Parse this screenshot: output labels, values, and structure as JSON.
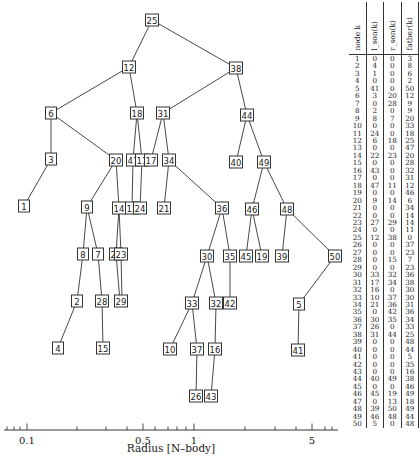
{
  "diagram": {
    "type": "binary_tree_over_log_radius_axis",
    "nodes": [
      {
        "id": "25",
        "x": 152,
        "y": 20
      },
      {
        "id": "12",
        "x": 129,
        "y": 67
      },
      {
        "id": "38",
        "x": 236,
        "y": 68
      },
      {
        "id": "6",
        "x": 51,
        "y": 113
      },
      {
        "id": "18",
        "x": 137,
        "y": 113
      },
      {
        "id": "31",
        "x": 163,
        "y": 113
      },
      {
        "id": "44",
        "x": 247,
        "y": 115
      },
      {
        "id": "3",
        "x": 51,
        "y": 159
      },
      {
        "id": "20",
        "x": 116,
        "y": 160
      },
      {
        "id": "47",
        "x": 133,
        "y": 160
      },
      {
        "id": "11",
        "x": 142,
        "y": 160
      },
      {
        "id": "17",
        "x": 151,
        "y": 160
      },
      {
        "id": "34",
        "x": 169,
        "y": 160
      },
      {
        "id": "40",
        "x": 236,
        "y": 162
      },
      {
        "id": "49",
        "x": 264,
        "y": 162
      },
      {
        "id": "1",
        "x": 24,
        "y": 206
      },
      {
        "id": "9",
        "x": 87,
        "y": 207
      },
      {
        "id": "14",
        "x": 119,
        "y": 208
      },
      {
        "id": "12",
        "x": 132,
        "y": 208
      },
      {
        "id": "24",
        "x": 140,
        "y": 208
      },
      {
        "id": "21",
        "x": 164,
        "y": 208
      },
      {
        "id": "36",
        "x": 222,
        "y": 208
      },
      {
        "id": "46",
        "x": 252,
        "y": 209
      },
      {
        "id": "48",
        "x": 287,
        "y": 209
      },
      {
        "id": "8",
        "x": 83,
        "y": 254
      },
      {
        "id": "7",
        "x": 98,
        "y": 254
      },
      {
        "id": "22",
        "x": 116,
        "y": 254
      },
      {
        "id": "23",
        "x": 121,
        "y": 254
      },
      {
        "id": "30",
        "x": 207,
        "y": 256
      },
      {
        "id": "35",
        "x": 230,
        "y": 256
      },
      {
        "id": "45",
        "x": 246,
        "y": 256
      },
      {
        "id": "19",
        "x": 262,
        "y": 256
      },
      {
        "id": "39",
        "x": 282,
        "y": 256
      },
      {
        "id": "50",
        "x": 335,
        "y": 256
      },
      {
        "id": "2",
        "x": 77,
        "y": 301
      },
      {
        "id": "28",
        "x": 102,
        "y": 301
      },
      {
        "id": "29",
        "x": 121,
        "y": 301
      },
      {
        "id": "33",
        "x": 192,
        "y": 303
      },
      {
        "id": "32",
        "x": 216,
        "y": 303
      },
      {
        "id": "42",
        "x": 230,
        "y": 303
      },
      {
        "id": "5",
        "x": 299,
        "y": 304
      },
      {
        "id": "4",
        "x": 58,
        "y": 348
      },
      {
        "id": "15",
        "x": 103,
        "y": 348
      },
      {
        "id": "10",
        "x": 170,
        "y": 349
      },
      {
        "id": "37",
        "x": 197,
        "y": 349
      },
      {
        "id": "16",
        "x": 215,
        "y": 349
      },
      {
        "id": "41",
        "x": 298,
        "y": 350
      },
      {
        "id": "26",
        "x": 196,
        "y": 396
      },
      {
        "id": "43",
        "x": 211,
        "y": 396
      }
    ],
    "edges": [
      [
        152,
        20,
        129,
        67
      ],
      [
        152,
        20,
        236,
        68
      ],
      [
        129,
        67,
        51,
        113
      ],
      [
        129,
        67,
        137,
        113
      ],
      [
        236,
        68,
        163,
        113
      ],
      [
        236,
        68,
        247,
        115
      ],
      [
        51,
        113,
        51,
        159
      ],
      [
        51,
        113,
        116,
        160
      ],
      [
        137,
        113,
        133,
        160
      ],
      [
        137,
        113,
        142,
        160
      ],
      [
        163,
        113,
        151,
        160
      ],
      [
        163,
        113,
        169,
        160
      ],
      [
        247,
        115,
        236,
        162
      ],
      [
        247,
        115,
        264,
        162
      ],
      [
        51,
        159,
        24,
        206
      ],
      [
        116,
        160,
        87,
        207
      ],
      [
        116,
        160,
        119,
        208
      ],
      [
        133,
        160,
        132,
        208
      ],
      [
        142,
        160,
        140,
        208
      ],
      [
        169,
        160,
        164,
        208
      ],
      [
        169,
        160,
        222,
        208
      ],
      [
        264,
        162,
        252,
        209
      ],
      [
        264,
        162,
        287,
        209
      ],
      [
        87,
        207,
        83,
        254
      ],
      [
        87,
        207,
        98,
        254
      ],
      [
        119,
        208,
        116,
        254
      ],
      [
        119,
        208,
        121,
        254
      ],
      [
        222,
        208,
        207,
        256
      ],
      [
        222,
        208,
        230,
        256
      ],
      [
        252,
        209,
        246,
        256
      ],
      [
        252,
        209,
        262,
        256
      ],
      [
        287,
        209,
        282,
        256
      ],
      [
        287,
        209,
        335,
        256
      ],
      [
        83,
        254,
        77,
        301
      ],
      [
        98,
        254,
        102,
        301
      ],
      [
        116,
        254,
        120,
        301
      ],
      [
        121,
        254,
        122,
        301
      ],
      [
        207,
        256,
        192,
        303
      ],
      [
        207,
        256,
        216,
        303
      ],
      [
        230,
        256,
        230,
        303
      ],
      [
        335,
        256,
        299,
        304
      ],
      [
        77,
        301,
        58,
        348
      ],
      [
        102,
        301,
        103,
        348
      ],
      [
        192,
        303,
        170,
        349
      ],
      [
        192,
        303,
        197,
        349
      ],
      [
        216,
        303,
        215,
        349
      ],
      [
        299,
        304,
        298,
        350
      ],
      [
        197,
        349,
        196,
        396
      ],
      [
        215,
        349,
        211,
        396
      ]
    ]
  },
  "axis": {
    "title": "Radius [N–body]",
    "y": 430,
    "x_start": 4,
    "x_end": 338,
    "major_ticks": [
      {
        "label": "0.1",
        "x": 27
      },
      {
        "label": "0.5",
        "x": 143
      },
      {
        "label": "1",
        "x": 194
      },
      {
        "label": "5",
        "x": 312
      }
    ],
    "minor_ticks_x": [
      7,
      14,
      20,
      77,
      106,
      127,
      155,
      168,
      177,
      186,
      245,
      275,
      296,
      325,
      332
    ]
  },
  "table": {
    "headers": [
      "node k",
      "l_son(k)",
      "r_son(k)",
      "father(k)"
    ],
    "rows": [
      [
        "1",
        "0",
        "0",
        "3"
      ],
      [
        "2",
        "4",
        "0",
        "8"
      ],
      [
        "3",
        "1",
        "0",
        "6"
      ],
      [
        "4",
        "0",
        "0",
        "2"
      ],
      [
        "5",
        "41",
        "0",
        "50"
      ],
      [
        "6",
        "3",
        "20",
        "12"
      ],
      [
        "7",
        "0",
        "28",
        "9"
      ],
      [
        "8",
        "2",
        "0",
        "9"
      ],
      [
        "9",
        "8",
        "7",
        "20"
      ],
      [
        "10",
        "0",
        "0",
        "33"
      ],
      [
        "11",
        "24",
        "0",
        "18"
      ],
      [
        "12",
        "6",
        "18",
        "25"
      ],
      [
        "13",
        "0",
        "0",
        "47"
      ],
      [
        "14",
        "22",
        "23",
        "20"
      ],
      [
        "15",
        "0",
        "0",
        "28"
      ],
      [
        "16",
        "43",
        "0",
        "32"
      ],
      [
        "17",
        "0",
        "0",
        "31"
      ],
      [
        "18",
        "47",
        "11",
        "12"
      ],
      [
        "19",
        "0",
        "0",
        "46"
      ],
      [
        "20",
        "9",
        "14",
        "6"
      ],
      [
        "21",
        "0",
        "0",
        "34"
      ],
      [
        "22",
        "0",
        "0",
        "14"
      ],
      [
        "23",
        "27",
        "29",
        "14"
      ],
      [
        "24",
        "0",
        "0",
        "11"
      ],
      [
        "25",
        "12",
        "38",
        "0"
      ],
      [
        "26",
        "0",
        "0",
        "37"
      ],
      [
        "27",
        "0",
        "0",
        "23"
      ],
      [
        "28",
        "0",
        "15",
        "7"
      ],
      [
        "29",
        "0",
        "0",
        "23"
      ],
      [
        "30",
        "33",
        "32",
        "36"
      ],
      [
        "31",
        "17",
        "34",
        "38"
      ],
      [
        "32",
        "16",
        "0",
        "30"
      ],
      [
        "33",
        "10",
        "37",
        "30"
      ],
      [
        "34",
        "21",
        "36",
        "31"
      ],
      [
        "35",
        "0",
        "42",
        "36"
      ],
      [
        "36",
        "30",
        "35",
        "34"
      ],
      [
        "37",
        "26",
        "0",
        "33"
      ],
      [
        "38",
        "31",
        "44",
        "25"
      ],
      [
        "39",
        "0",
        "0",
        "48"
      ],
      [
        "40",
        "0",
        "0",
        "44"
      ],
      [
        "41",
        "0",
        "0",
        "5"
      ],
      [
        "42",
        "0",
        "0",
        "35"
      ],
      [
        "43",
        "0",
        "0",
        "16"
      ],
      [
        "44",
        "40",
        "49",
        "38"
      ],
      [
        "45",
        "0",
        "0",
        "46"
      ],
      [
        "46",
        "45",
        "19",
        "49"
      ],
      [
        "47",
        "0",
        "13",
        "18"
      ],
      [
        "48",
        "39",
        "50",
        "49"
      ],
      [
        "49",
        "46",
        "48",
        "44"
      ],
      [
        "50",
        "5",
        "0",
        "48"
      ]
    ]
  }
}
